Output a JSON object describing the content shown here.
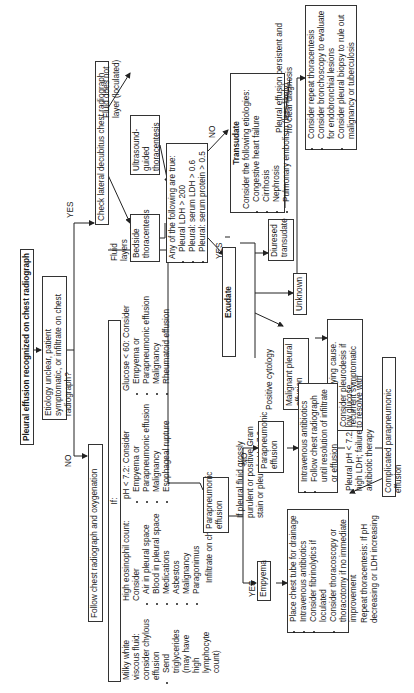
{
  "diagram": {
    "start": "Pleural effusion recognized on chest radiograph",
    "question1": "Etiology unclear, patient symptomatic, or infiltrate on chest radiograph?",
    "labels": {
      "yes": "YES",
      "no": "NO",
      "fluid_layers": "Fluid layers (>10 mm)",
      "fluid_not_layer": "Fluid does not layer (loculated)",
      "infiltrate": "Infiltrate on chest radiograph",
      "positive_cytology": "Positive cytology",
      "persistent": "Pleural effusion persistent and no clear diagnosis",
      "grossly_purulent": "If pleural fluid grossly purulent or positive Gram stain or pleural pH < 7.0",
      "repeat_thoracentesis": "Repeat thoracentesis: If pH decreasing or LDH increasing"
    },
    "follow": "Follow chest radiograph and oxygenation",
    "decubitus": "Check lateral decubitus chest radiograph",
    "bedside": "Bedside thoracentesis",
    "ultrasound": "Ultrasound-guided thoracentesis",
    "lights": {
      "title": "Any of the following are true:",
      "items": [
        "Pleural LDH > 200",
        "Pleural: serum LDH > 0.6",
        "Pleural: serum protein > 0.5"
      ]
    },
    "transudate": {
      "title": "Transudate",
      "intro": "Consider the following etiologies:",
      "items": [
        "Congestive heart failure",
        "Cirrhosis",
        "Nephrosis",
        "Pulmonary embolism (less likely)"
      ]
    },
    "exudate": "Exudate",
    "diuresed": "Diuresed transudate",
    "unknown": "Unknown",
    "malignant": "Malignant pleural effusion",
    "treat": "Treat underlying cause. Consider pleurodesis if recurrent symptomatic",
    "persistent_actions": {
      "items": [
        "Consider repeat thoracentesis",
        "Consider bronchoscopy to evaluate for endobronchial lesions",
        "Consider pleural biopsy to rule out malignancy or tuberculosis"
      ]
    },
    "if_box": "If:",
    "criteria": {
      "milky": {
        "title": "Milky white viscous fluid: consider chylous effusion",
        "items": [
          "Send triglycerides (may have high lymphocyte count)"
        ]
      },
      "eosinophil": {
        "title": "High eosinophil count: Consider",
        "items": [
          "Air in pleural space",
          "Blood in pleural space",
          "Medications",
          "Asbestos",
          "Malignancy",
          "Paragonimus"
        ]
      },
      "ph": {
        "title": "pH < 7.2: Consider",
        "items": [
          "Empyema or",
          "Parapneumonic effusion",
          "Malignancy",
          "Esophageal rupture"
        ]
      },
      "glucose": {
        "title": "Glucose < 60: Consider",
        "items": [
          "Empyema or",
          "Parapneumonic effusion",
          "Malignancy",
          "Rheumatoid effusion"
        ]
      }
    },
    "parapneumonic": "Parapneumonic effusion",
    "parapneumonic2": "Parapneumonic effusion",
    "empyema": "Empyema",
    "empyema_actions": [
      "Place chest tube for drainage",
      "Intravenous antibiotics",
      "Consider fibrinolytics if loculated",
      "Consider thoracoscopy or thoracotomy if no immediate improvement"
    ],
    "para_actions": [
      "Intravenous antibiotics",
      "Follow chest radiograph until resolution of infiltrate or effusion"
    ],
    "failure": "Pleural pH < 7.2, low glucose, high LDH; failure to resolve with antibiotic therapy",
    "complicated": "Complicated parapneumonic effusion"
  }
}
